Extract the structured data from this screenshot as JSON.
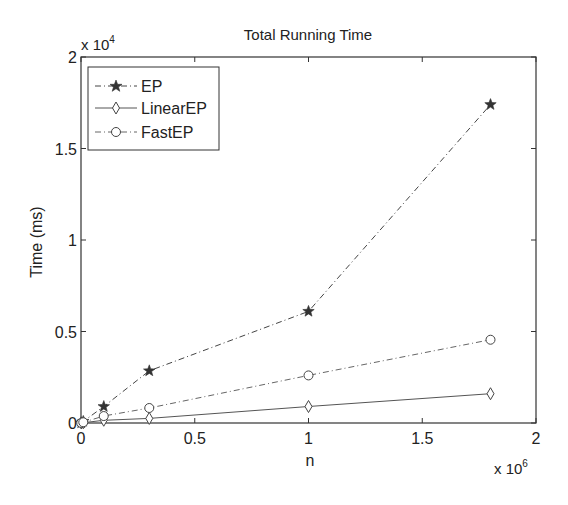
{
  "chart_data": {
    "type": "line",
    "title": "Total Running Time",
    "xlabel": "n",
    "ylabel": "Time (ms)",
    "x_multiplier": "x 10^6",
    "y_multiplier": "x 10^4",
    "xlim": [
      0,
      2000000
    ],
    "ylim": [
      0,
      20000
    ],
    "x_ticks": [
      "0",
      "0.5",
      "1",
      "1.5",
      "2"
    ],
    "y_ticks": [
      "0",
      "0.5",
      "1",
      "1.5",
      "2"
    ],
    "grid": false,
    "legend_position": "upper left",
    "x": [
      1000,
      10000,
      100000,
      300000,
      1000000,
      1800000
    ],
    "series": [
      {
        "name": "EP",
        "marker": "star",
        "linestyle": "dash-dot",
        "values": [
          10,
          90,
          900,
          2850,
          6100,
          17400
        ]
      },
      {
        "name": "LinearEP",
        "marker": "diamond",
        "linestyle": "solid",
        "values": [
          2,
          15,
          150,
          250,
          900,
          1600
        ]
      },
      {
        "name": "FastEP",
        "marker": "circle",
        "linestyle": "dash-dot",
        "values": [
          4,
          40,
          380,
          820,
          2600,
          4550
        ]
      }
    ]
  },
  "labels": {
    "title": "Total Running Time",
    "xlabel": "n",
    "ylabel": "Time (ms)",
    "x_mult_base": "x 10",
    "x_mult_exp": "6",
    "y_mult_base": "x 10",
    "y_mult_exp": "4",
    "legend": [
      "EP",
      "LinearEP",
      "FastEP"
    ]
  }
}
